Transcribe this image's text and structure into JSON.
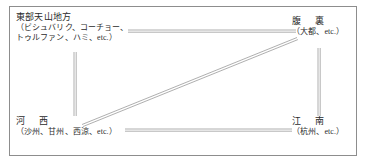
{
  "figure": {
    "type": "network-diagram",
    "frame_color": "#8d8d8d",
    "line_color": "#9a9a9a",
    "text_color": "#2b2b2b",
    "background": "#ffffff"
  },
  "nodes": [
    {
      "id": "northwest",
      "name": "eastern-tianshan",
      "title": "東部天山地方",
      "sub_line1": "（ビシュバリク、コーチョー、",
      "sub_line2": "トゥルファン、ハミ、etc.）"
    },
    {
      "id": "northeast",
      "name": "fukuri",
      "title_part1": "腹",
      "title_part2": "裏",
      "sub_line1": "（大都、etc.）"
    },
    {
      "id": "southwest",
      "name": "hexi",
      "title_part1": "河",
      "title_part2": "西",
      "sub_line1": "（沙州、甘州、西涼、etc.）"
    },
    {
      "id": "southeast",
      "name": "jiangnan",
      "title_part1": "江",
      "title_part2": "南",
      "sub_line1": "（杭州、etc.）"
    }
  ],
  "edges": [
    {
      "name": "top-edge",
      "from": "northwest",
      "to": "northeast",
      "style": "double-line"
    },
    {
      "name": "bottom-edge",
      "from": "southwest",
      "to": "southeast",
      "style": "double-line"
    },
    {
      "name": "left-edge",
      "from": "northwest",
      "to": "southwest",
      "style": "double-line"
    },
    {
      "name": "right-edge",
      "from": "northeast",
      "to": "southeast",
      "style": "double-line"
    },
    {
      "name": "diagonal-edge",
      "from": "southwest",
      "to": "northeast",
      "style": "double-line"
    }
  ]
}
